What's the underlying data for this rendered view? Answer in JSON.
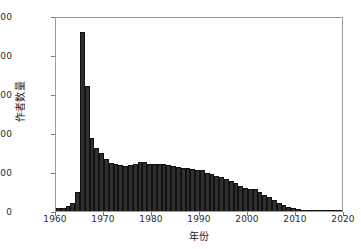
{
  "chart_data": {
    "type": "bar",
    "title": "",
    "subtitle": "",
    "xlabel": "年份",
    "ylabel": "作者数量",
    "xlim": [
      1960,
      2020
    ],
    "ylim": [
      0,
      10000
    ],
    "grid": false,
    "legend": null,
    "bar_color": "#2f2f2f",
    "edge_color": "#111111",
    "xticks": [
      1960,
      1970,
      1980,
      1990,
      2000,
      2010,
      2020
    ],
    "xtick_labels": [
      "1960",
      "1970",
      "1980",
      "1990",
      "2000",
      "2010",
      "2020"
    ],
    "yticks": [
      0,
      2000,
      4000,
      6000,
      8000,
      10000
    ],
    "ytick_labels": [
      "0",
      "2000",
      "4000",
      "6000",
      "8000",
      "10000"
    ],
    "bin_width": 1,
    "categories": [
      1960,
      1961,
      1962,
      1963,
      1964,
      1965,
      1966,
      1967,
      1968,
      1969,
      1970,
      1971,
      1972,
      1973,
      1974,
      1975,
      1976,
      1977,
      1978,
      1979,
      1980,
      1981,
      1982,
      1983,
      1984,
      1985,
      1986,
      1987,
      1988,
      1989,
      1990,
      1991,
      1992,
      1993,
      1994,
      1995,
      1996,
      1997,
      1998,
      1999,
      2000,
      2001,
      2002,
      2003,
      2004,
      2005,
      2006,
      2007,
      2008,
      2009,
      2010,
      2011,
      2012,
      2013,
      2014,
      2015,
      2016,
      2017,
      2018,
      2019
    ],
    "values": [
      150,
      170,
      260,
      430,
      1000,
      9200,
      6400,
      3750,
      3250,
      2950,
      2650,
      2450,
      2400,
      2350,
      2330,
      2370,
      2420,
      2530,
      2500,
      2430,
      2430,
      2420,
      2400,
      2350,
      2330,
      2250,
      2220,
      2200,
      2150,
      2120,
      2080,
      1950,
      1880,
      1820,
      1730,
      1630,
      1520,
      1430,
      1300,
      1200,
      1130,
      1120,
      950,
      830,
      700,
      560,
      420,
      300,
      200,
      130,
      90,
      60,
      45,
      30,
      22,
      16,
      12,
      8,
      5,
      3
    ]
  }
}
